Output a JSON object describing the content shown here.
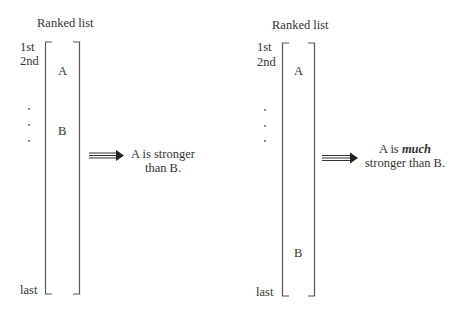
{
  "panels": [
    {
      "title": "Ranked list",
      "rank_labels": {
        "first": "1st",
        "second": "2nd",
        "last": "last"
      },
      "items": [
        {
          "label": "A",
          "position": "2nd"
        },
        {
          "label": "B",
          "position": "near top"
        }
      ],
      "ellipsis": "· · ·",
      "conclusion": {
        "line1": "A is stronger",
        "line2": "than B."
      }
    },
    {
      "title": "Ranked list",
      "rank_labels": {
        "first": "1st",
        "second": "2nd",
        "last": "last"
      },
      "items": [
        {
          "label": "A",
          "position": "2nd"
        },
        {
          "label": "B",
          "position": "near bottom"
        }
      ],
      "ellipsis": "· · ·",
      "conclusion": {
        "line1_prefix": "A is ",
        "line1_emphasis": "much",
        "line2": "stronger than B."
      }
    }
  ],
  "colors": {
    "line": "#555555",
    "text": "#333333",
    "background": "#ffffff"
  }
}
